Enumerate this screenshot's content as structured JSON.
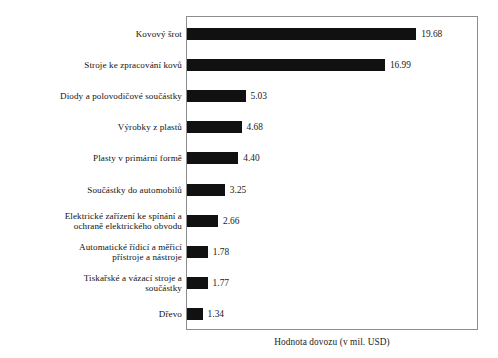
{
  "chart_data": {
    "type": "bar",
    "orientation": "horizontal",
    "title": "",
    "subtitle": "",
    "xlabel": "Hodnota dovozu (v mil. USD)",
    "ylabel": "",
    "grid": false,
    "legend": null,
    "xlim": [
      0,
      24.9
    ],
    "value_format": "2dp",
    "categories": [
      "Kovový šrot",
      "Stroje ke zpracování kovů",
      "Diody a polovodičové součástky",
      "Výrobky z plastů",
      "Plasty v primární formě",
      "Součástky do automobilů",
      "Elektrické zařízení ke spínání a\nochraně elektrického obvodu",
      "Automatické řídicí a měřicí\npřístroje a nástroje",
      "Tiskařské a vázací stroje a\nsoučástky",
      "Dřevo"
    ],
    "values": [
      19.68,
      16.99,
      5.03,
      4.68,
      4.4,
      3.25,
      2.66,
      1.78,
      1.77,
      1.34
    ],
    "value_labels": [
      "19.68",
      "16.99",
      "5.03",
      "4.68",
      "4.40",
      "3.25",
      "2.66",
      "1.78",
      "1.77",
      "1.34"
    ],
    "bar_color": "#111111",
    "frame_color": "#8d8d8d",
    "background": "#ffffff"
  },
  "caption": {
    "text": "Hodnota dovozu (v mil. USD)"
  }
}
